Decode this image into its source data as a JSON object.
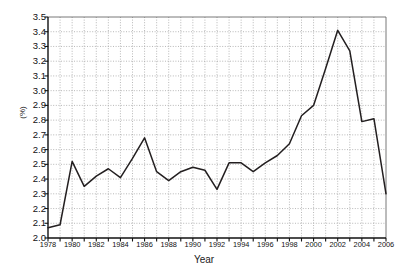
{
  "chart_data": {
    "type": "line",
    "title": "",
    "xlabel": "Year",
    "ylabel": "(%)",
    "xlim": [
      1978,
      2006
    ],
    "ylim": [
      2.0,
      3.5
    ],
    "ytick_step": 0.1,
    "xtick_step": 1,
    "xtick_label_step": 2,
    "grid": true,
    "grid_style": "dotted",
    "legend": "none",
    "line_color": "#231f20",
    "x": [
      1978,
      1979,
      1980,
      1981,
      1982,
      1983,
      1984,
      1985,
      1986,
      1987,
      1988,
      1989,
      1990,
      1991,
      1992,
      1993,
      1994,
      1995,
      1996,
      1997,
      1998,
      1999,
      2000,
      2001,
      2002,
      2003,
      2004,
      2005,
      2006
    ],
    "values": [
      2.07,
      2.09,
      2.52,
      2.35,
      2.42,
      2.47,
      2.41,
      2.54,
      2.68,
      2.45,
      2.39,
      2.45,
      2.48,
      2.46,
      2.33,
      2.51,
      2.51,
      2.45,
      2.51,
      2.56,
      2.64,
      2.83,
      2.9,
      3.15,
      3.41,
      3.27,
      2.79,
      2.81,
      2.3
    ],
    "ytick_labels": [
      "2.0",
      "2.1",
      "2.2",
      "2.3",
      "2.4",
      "2.5",
      "2.6",
      "2.7",
      "2.8",
      "2.9",
      "3.0",
      "3.1",
      "3.2",
      "3.3",
      "3.4",
      "3.5"
    ],
    "xtick_labels": [
      "1978",
      "1980",
      "1982",
      "1984",
      "1986",
      "1988",
      "1990",
      "1992",
      "1994",
      "1996",
      "1998",
      "2000",
      "2002",
      "2004",
      "2006"
    ]
  }
}
